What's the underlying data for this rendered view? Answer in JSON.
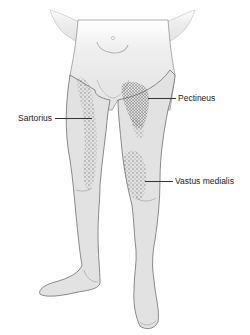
{
  "figure": {
    "colors": {
      "skin": "#e2e2e2",
      "outline": "#6f6f6f",
      "stipple": "#6a6a6a",
      "label_text": "#222222",
      "background": "#ffffff"
    }
  },
  "labels": [
    {
      "id": "pectineus",
      "text": "Pectineus",
      "x": 178,
      "y": 93,
      "line_from_x": 148,
      "line_to_x": 176,
      "line_y": 98
    },
    {
      "id": "sartorius",
      "text": "Sartorius",
      "x": 18,
      "y": 113,
      "line_from_x": 55,
      "line_to_x": 92,
      "line_y": 118
    },
    {
      "id": "vastus-medialis",
      "text": "Vastus medialis",
      "x": 175,
      "y": 176,
      "line_from_x": 145,
      "line_to_x": 173,
      "line_y": 181
    }
  ]
}
